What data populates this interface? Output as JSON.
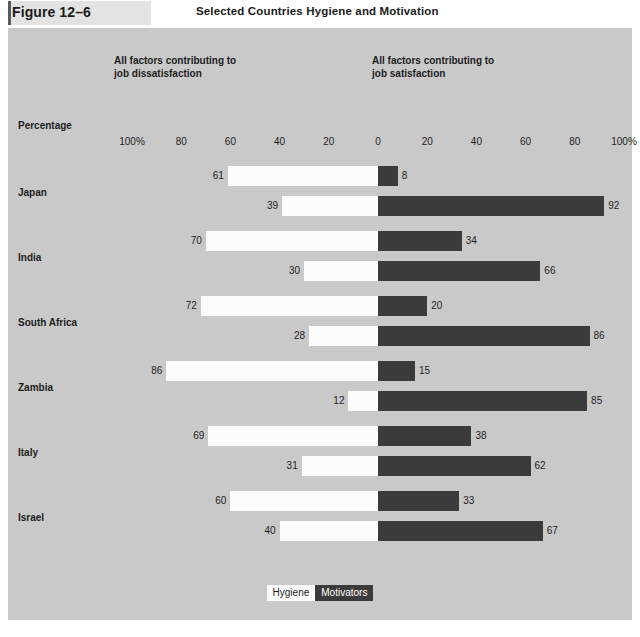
{
  "header": {
    "figure_label": "Figure 12–6",
    "title": "Selected Countries Hygiene and Motivation"
  },
  "panel": {
    "caption_left": "All factors contributing to\njob dissatisfaction",
    "caption_right": "All factors contributing to\njob satisfaction",
    "percentage_label": "Percentage"
  },
  "legend": {
    "hygiene": "Hygiene",
    "motivators": "Motivators"
  },
  "colors": {
    "page_background": "#ffffff",
    "panel_background": "#c9c9c9",
    "figure_box": "#e3e3e3",
    "figure_rule": "#555a5e",
    "hygiene_bar": "#fcfcfc",
    "motivators_bar": "#3b3b3b",
    "text": "#1d1d1d"
  },
  "chart_data": {
    "type": "bar",
    "title": "Selected Countries Hygiene and Motivation",
    "subtitle": "",
    "xlabel": "Percentage",
    "ylabel": "",
    "orientation": "horizontal",
    "layout": "diverging-bidirectional",
    "grid": false,
    "legend_position": "bottom-center",
    "axis": {
      "tick_labels": [
        "100%",
        "80",
        "60",
        "40",
        "20",
        "0",
        "20",
        "40",
        "60",
        "80",
        "100%"
      ],
      "tick_values": [
        -100,
        -80,
        -60,
        -40,
        -20,
        0,
        20,
        40,
        60,
        80,
        100
      ],
      "xlim": [
        -100,
        100
      ],
      "center_value": 0,
      "left_direction_meaning": "All factors contributing to job dissatisfaction",
      "right_direction_meaning": "All factors contributing to job satisfaction"
    },
    "categories": [
      "Japan",
      "India",
      "South Africa",
      "Zambia",
      "Italy",
      "Israel"
    ],
    "series": [
      {
        "name": "Hygiene",
        "dissatisfaction": [
          61,
          70,
          72,
          86,
          69,
          60
        ],
        "satisfaction": [
          8,
          34,
          20,
          15,
          38,
          33
        ]
      },
      {
        "name": "Motivators",
        "dissatisfaction": [
          39,
          30,
          28,
          12,
          31,
          40
        ],
        "satisfaction": [
          92,
          66,
          86,
          85,
          62,
          67
        ]
      }
    ],
    "groups": [
      {
        "country": "Japan",
        "rows": [
          {
            "series": "Hygiene",
            "left": 61,
            "right": 8
          },
          {
            "series": "Motivators",
            "left": 39,
            "right": 92
          }
        ]
      },
      {
        "country": "India",
        "rows": [
          {
            "series": "Hygiene",
            "left": 70,
            "right": 34
          },
          {
            "series": "Motivators",
            "left": 30,
            "right": 66
          }
        ]
      },
      {
        "country": "South Africa",
        "rows": [
          {
            "series": "Hygiene",
            "left": 72,
            "right": 20
          },
          {
            "series": "Motivators",
            "left": 28,
            "right": 86
          }
        ]
      },
      {
        "country": "Zambia",
        "rows": [
          {
            "series": "Hygiene",
            "left": 86,
            "right": 15
          },
          {
            "series": "Motivators",
            "left": 12,
            "right": 85
          }
        ]
      },
      {
        "country": "Italy",
        "rows": [
          {
            "series": "Hygiene",
            "left": 69,
            "right": 38
          },
          {
            "series": "Motivators",
            "left": 31,
            "right": 62
          }
        ]
      },
      {
        "country": "Israel",
        "rows": [
          {
            "series": "Hygiene",
            "left": 60,
            "right": 33
          },
          {
            "series": "Motivators",
            "left": 40,
            "right": 67
          }
        ]
      }
    ]
  }
}
